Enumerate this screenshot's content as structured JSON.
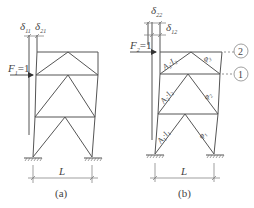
{
  "figure_a": {
    "caption": "(a)",
    "span_label": "L",
    "force_label": "F",
    "force_sub": "1",
    "force_value": "=1",
    "disp_labels": [
      {
        "symbol": "δ",
        "sub": "11"
      },
      {
        "symbol": "δ",
        "sub": "21"
      }
    ]
  },
  "figure_b": {
    "caption": "(b)",
    "span_label": "L",
    "force_label": "F",
    "force_sub": "2",
    "force_value": "=1",
    "disp_labels": [
      {
        "symbol": "δ",
        "sub": "22"
      },
      {
        "symbol": "δ",
        "sub": "12"
      }
    ],
    "member_labels": [
      {
        "text": "A",
        "sub": "2",
        "mid": "·",
        "text2": "I",
        "sub2": "2"
      },
      {
        "text": "A",
        "sub": "2",
        "mid": "·",
        "text2": "I",
        "sub2": "2"
      },
      {
        "text": "A",
        "sub": "1",
        "mid": "·",
        "text2": "I",
        "sub2": "1"
      }
    ],
    "angle_labels": [
      {
        "symbol": "φ",
        "sub": "3"
      },
      {
        "symbol": "φ",
        "sub": "2"
      },
      {
        "symbol": "φ",
        "sub": "1"
      }
    ],
    "level_markers": [
      "2",
      "1"
    ]
  }
}
